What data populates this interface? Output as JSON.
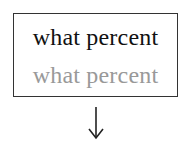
{
  "box": {
    "line1": "what percent",
    "line2": "what percent"
  },
  "arrow": {
    "icon": "arrow-down-icon",
    "direction": "down"
  },
  "colors": {
    "primary_text": "#111111",
    "secondary_text": "#999999",
    "border": "#333333"
  }
}
